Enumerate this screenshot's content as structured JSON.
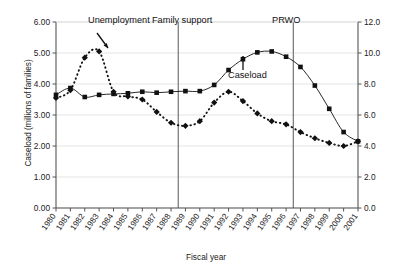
{
  "chart_data": {
    "type": "line",
    "title": "",
    "xlabel": "Fiscal year",
    "ylabel": "Caseload (millions of families)",
    "ylabel_right": "Unemployment rate (%)",
    "grid": true,
    "legend_position": "inline-annotations",
    "x": [
      1980,
      1981,
      1982,
      1983,
      1984,
      1985,
      1986,
      1987,
      1988,
      1989,
      1990,
      1991,
      1992,
      1993,
      1994,
      1995,
      1996,
      1997,
      1998,
      1999,
      2000,
      2001
    ],
    "xtick_labels": [
      "1980",
      "1981",
      "1982",
      "1983",
      "1984",
      "1985",
      "1986",
      "1987",
      "1988",
      "1989",
      "1990",
      "1991",
      "1992",
      "1993",
      "1994",
      "1995",
      "1996",
      "1997",
      "1998",
      "1999",
      "2000",
      "2001"
    ],
    "xlim": [
      1980,
      2001
    ],
    "ylim": [
      0.0,
      6.0
    ],
    "ytick_labels": [
      "0.00",
      "1.00",
      "2.00",
      "3.00",
      "4.00",
      "5.00",
      "6.00"
    ],
    "ytick_values": [
      0.0,
      1.0,
      2.0,
      3.0,
      4.0,
      5.0,
      6.0
    ],
    "ylim_right": [
      0.0,
      12.0
    ],
    "ytick_labels_right": [
      "0.0",
      "2.0",
      "4.0",
      "6.0",
      "8.0",
      "10.0",
      "12.0"
    ],
    "ytick_values_right": [
      0.0,
      2.0,
      4.0,
      6.0,
      8.0,
      10.0,
      12.0
    ],
    "series": [
      {
        "name": "Caseload",
        "axis": "left",
        "marker": "square",
        "linestyle": "solid",
        "color": "#111111",
        "values": [
          3.65,
          3.87,
          3.58,
          3.65,
          3.68,
          3.7,
          3.75,
          3.72,
          3.75,
          3.77,
          3.77,
          3.97,
          4.45,
          4.8,
          5.02,
          5.05,
          4.88,
          4.55,
          3.95,
          3.2,
          2.45,
          2.15
        ]
      },
      {
        "name": "Unemployment",
        "axis": "right",
        "marker": "diamond",
        "linestyle": "dotted",
        "color": "#111111",
        "values": [
          7.1,
          7.6,
          9.7,
          10.1,
          7.5,
          7.2,
          7.0,
          6.2,
          5.5,
          5.3,
          5.6,
          6.8,
          7.5,
          6.9,
          6.1,
          5.6,
          5.4,
          4.9,
          4.5,
          4.2,
          4.0,
          4.3
        ]
      }
    ],
    "annotations": [
      {
        "name": "unemployment-label",
        "text": "Unemployment"
      },
      {
        "name": "caseload-label",
        "text": "Caseload"
      },
      {
        "name": "family-support-event",
        "text": "Family support",
        "x": 1988.5
      },
      {
        "name": "prwo-event",
        "text": "PRWO",
        "x": 1996.5
      }
    ],
    "vlines": [
      {
        "label": "Family support",
        "x": 1988.5
      },
      {
        "label": "PRWO",
        "x": 1996.5
      }
    ]
  },
  "axes": {
    "x_title": "Fiscal year",
    "y_title_left": "Caseload (millions of families)",
    "y_title_right": "Unemployment rate (%)"
  }
}
